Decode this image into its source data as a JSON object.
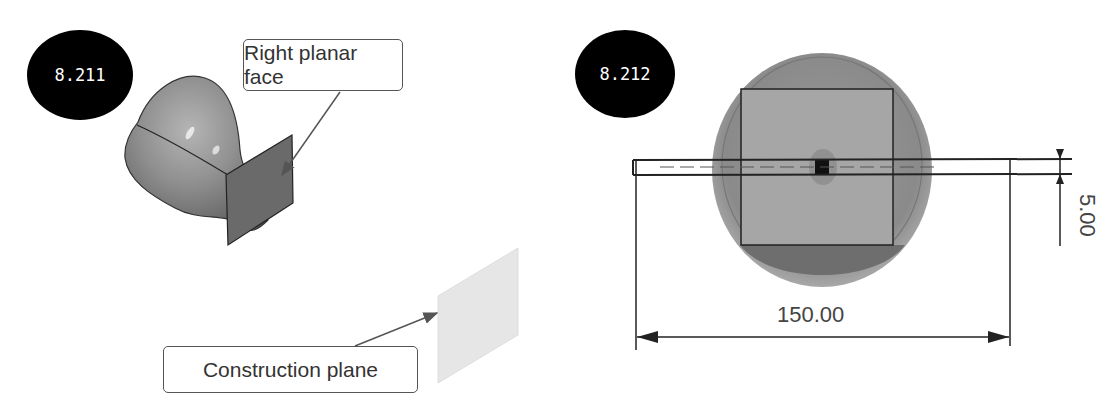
{
  "figures": [
    {
      "id_label": "8.211",
      "callouts": {
        "right_planar_face": "Right planar face",
        "construction_plane": "Construction plane"
      }
    },
    {
      "id_label": "8.212",
      "dimensions": {
        "width": "150.00",
        "thickness": "5.00"
      }
    }
  ],
  "colors": {
    "badge_bg": "#000000",
    "badge_fg": "#ffffff",
    "model_gray": "#8a8a8a",
    "plane_gray": "#e6e6e6",
    "line": "#222222"
  }
}
